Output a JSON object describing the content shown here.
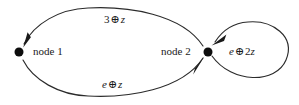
{
  "figure": {
    "type": "directed-graph",
    "background_color": "#ffffff",
    "stroke_color": "#2b2b2b",
    "text_color": "#1a1a1a"
  },
  "nodes": [
    {
      "id": "node1",
      "label": "node 1",
      "x": 19,
      "y": 52,
      "radius": 4.5
    },
    {
      "id": "node2",
      "label": "node 2",
      "x": 208,
      "y": 52,
      "radius": 4.5
    }
  ],
  "edges": [
    {
      "id": "edge-node2-to-node1",
      "from": "node2",
      "to": "node1",
      "label_parts": {
        "coefficient": "3",
        "operator": "⊕",
        "variable": "z"
      },
      "label": "3 ⊕ z",
      "direction": "right-to-left",
      "curve": "arc-above"
    },
    {
      "id": "edge-node1-to-node2",
      "from": "node1",
      "to": "node2",
      "label_parts": {
        "coefficient": "e",
        "operator": "⊕",
        "variable": "z"
      },
      "label": "e ⊕ z",
      "direction": "left-to-right",
      "curve": "arc-below"
    },
    {
      "id": "edge-node2-self-loop",
      "from": "node2",
      "to": "node2",
      "label_parts": {
        "coefficient": "e",
        "operator": "⊕",
        "multiplier": "2",
        "variable": "z"
      },
      "label": "e ⊕ 2z",
      "direction": "self-loop",
      "curve": "loop-right"
    }
  ]
}
